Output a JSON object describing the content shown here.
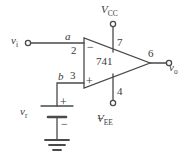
{
  "figure": {
    "name": "op-amp comparator circuit",
    "background_color": "#ffffff",
    "line_color": "#4a4a4a",
    "text_color": "#3a3a3a"
  },
  "opamp": {
    "part_number": "741",
    "inverting_sign": "−",
    "noninverting_sign": "+",
    "pins": {
      "inverting_input": "2",
      "noninverting_input": "3",
      "output": "6",
      "positive_supply": "7",
      "negative_supply": "4"
    }
  },
  "nodes": {
    "a": "a",
    "b": "b"
  },
  "signals": {
    "input": {
      "symbol": "v",
      "subscript": "i"
    },
    "output": {
      "symbol": "v",
      "subscript": "o"
    },
    "reference": {
      "symbol": "v",
      "subscript": "r"
    }
  },
  "supplies": {
    "positive": {
      "prefix": "",
      "symbol": "V",
      "subscript": "CC"
    },
    "negative": {
      "prefix": "−",
      "symbol": "V",
      "subscript": "EE"
    }
  },
  "battery": {
    "positive_sign": "+",
    "negative_sign": "−"
  },
  "ground": {
    "symbol_name": "earth-ground"
  }
}
